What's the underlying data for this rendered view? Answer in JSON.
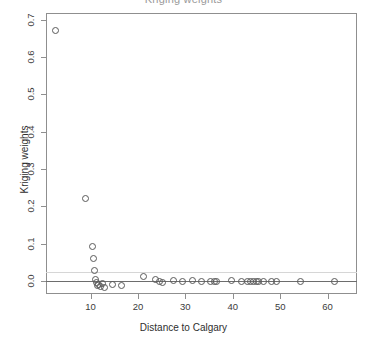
{
  "chart_data": {
    "type": "scatter",
    "title": "Kriging weights",
    "xlabel": "Distance to Calgary",
    "ylabel": "Kriging weights",
    "xlim": [
      0.6,
      66.2
    ],
    "ylim": [
      -0.035,
      0.718
    ],
    "xticks": [
      10,
      20,
      30,
      40,
      50,
      60
    ],
    "xticklabels": [
      "10",
      "20",
      "30",
      "40",
      "50",
      "60"
    ],
    "yticks": [
      0.0,
      0.1,
      0.2,
      0.3,
      0.4,
      0.5,
      0.6,
      0.7
    ],
    "yticklabels": [
      "0.0",
      "0.1",
      "0.2",
      "0.3",
      "0.4",
      "0.5",
      "0.6",
      "0.7"
    ],
    "grid": false,
    "legend": null,
    "marker": "open-circle",
    "marker_color": "#5a5a5a",
    "reference_lines": [
      {
        "name": "zero-line",
        "axis": "y",
        "value": 0.0,
        "color": "#6d6d6d"
      },
      {
        "name": "upper-bound-line",
        "axis": "y",
        "value": 0.025,
        "color": "#d6d6d6"
      }
    ],
    "x": [
      2.6,
      8.8,
      10.4,
      10.6,
      10.8,
      10.9,
      11.2,
      11.4,
      11.6,
      12.0,
      12.4,
      12.8,
      14.6,
      16.4,
      21.0,
      23.6,
      24.4,
      25.0,
      27.4,
      29.2,
      31.4,
      33.2,
      35.2,
      36.0,
      36.4,
      39.6,
      41.8,
      43.0,
      43.6,
      44.2,
      44.8,
      45.4,
      46.4,
      48.0,
      49.2,
      54.2,
      61.4
    ],
    "y": [
      0.672,
      0.222,
      0.094,
      0.062,
      0.028,
      0.005,
      -0.004,
      -0.01,
      -0.007,
      -0.013,
      -0.006,
      -0.016,
      -0.009,
      -0.01,
      0.012,
      0.004,
      0.0,
      -0.002,
      0.003,
      -0.001,
      0.002,
      0.0,
      0.001,
      0.001,
      0.001,
      0.002,
      0.001,
      0.0,
      0.001,
      0.001,
      0.0,
      0.001,
      0.0,
      0.001,
      0.0,
      0.0,
      0.0
    ]
  }
}
